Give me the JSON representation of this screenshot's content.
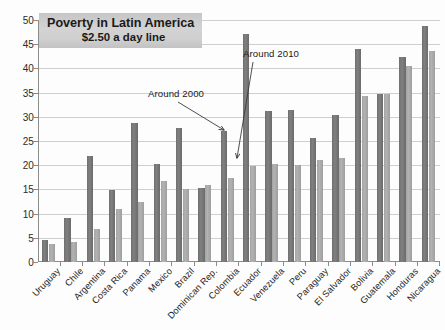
{
  "chart_data": {
    "type": "bar",
    "title": "Poverty in Latin America",
    "subtitle": "$2.50 a day line",
    "xlabel": "",
    "ylabel": "",
    "ylim": [
      0,
      50
    ],
    "ytick_step": 5,
    "grid": true,
    "legend_position": "none",
    "yticks": [
      "0",
      "5",
      "10",
      "15",
      "20",
      "25",
      "30",
      "35",
      "40",
      "45",
      "50"
    ],
    "categories": [
      "Uruguay",
      "Chile",
      "Argentina",
      "Costa Rica",
      "Panama",
      "Mexico",
      "Brazil",
      "Dominican Rep.",
      "Colombia",
      "Ecuador",
      "Venezuela",
      "Peru",
      "Paraguay",
      "El Salvador",
      "Bolivia",
      "Guatemala",
      "Honduras",
      "Nicaragua"
    ],
    "series": [
      {
        "name": "Around 2000",
        "color": "#767676",
        "values": [
          4.5,
          9.0,
          22.0,
          14.8,
          28.8,
          20.2,
          27.6,
          15.3,
          27.1,
          47.2,
          31.2,
          31.4,
          25.7,
          30.3,
          44.0,
          34.8,
          42.3,
          48.8
        ]
      },
      {
        "name": "Around 2010",
        "color": "#a9a9a9",
        "values": [
          3.8,
          4.2,
          6.8,
          11.0,
          12.4,
          16.7,
          15.1,
          16.0,
          17.3,
          19.8,
          20.2,
          20.0,
          21.0,
          21.5,
          34.2,
          34.8,
          40.4,
          43.5
        ]
      }
    ],
    "annotations": [
      {
        "label": "Around 2000",
        "points_to_series": "Around 2000",
        "points_to_category": "Colombia"
      },
      {
        "label": "Around 2010",
        "points_to_series": "Around 2010",
        "points_to_category": "Ecuador"
      }
    ]
  }
}
